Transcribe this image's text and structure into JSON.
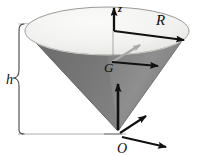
{
  "figure": {
    "name": "inverted-cone-geometry-diagram",
    "background_color": "#ffffff"
  },
  "labels": {
    "radius": "R",
    "height": "h",
    "centroid": "G",
    "origin": "O",
    "axis_vertical": "z"
  },
  "colors": {
    "cone_surface_dark": "#7a7a7a",
    "cone_surface_mid": "#8d8d8d",
    "top_disk_light": "#f0f0ee",
    "top_disk_shadow": "#dcdcda",
    "outline": "#4a4a4a",
    "arrow_dark": "#111111",
    "arrow_gray": "#a8a8a8",
    "leader_line": "#9a9a9a",
    "text": "#0d0d0d"
  },
  "geometry": {
    "apex": {
      "x": 118,
      "y": 131
    },
    "centroid": {
      "x": 118,
      "y": 62
    },
    "origin": {
      "x": 122,
      "y": 133
    },
    "ellipse_center": {
      "x": 107,
      "y": 31
    },
    "ellipse_rx": 82,
    "ellipse_ry": 24,
    "radius_arrow_end": {
      "x": 189,
      "y": 40
    },
    "height_brace_top": 24,
    "height_brace_bottom": 134
  }
}
